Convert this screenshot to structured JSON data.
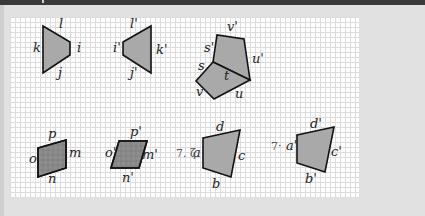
{
  "colors": {
    "fill": "#a9a9a9",
    "fill_dark": "#8e8e8e",
    "stroke": "#111111",
    "grid": "#dcdcdc",
    "background": "#e1e1e1"
  },
  "figures": [
    {
      "id": "trapezoid-1",
      "points": "43,26 70,42 70,55 43,73",
      "labels": [
        {
          "text": "l",
          "x": 59,
          "y": 28
        },
        {
          "text": "i",
          "x": 77,
          "y": 52
        },
        {
          "text": "j",
          "x": 58,
          "y": 77
        },
        {
          "text": "k",
          "x": 33,
          "y": 52
        }
      ]
    },
    {
      "id": "trapezoid-2",
      "points": "123,42 151,26 151,73 123,55",
      "labels": [
        {
          "text": "l'",
          "x": 130,
          "y": 28
        },
        {
          "text": "k'",
          "x": 156,
          "y": 54
        },
        {
          "text": "j'",
          "x": 130,
          "y": 77
        },
        {
          "text": "i'",
          "x": 113,
          "y": 52
        }
      ]
    },
    {
      "id": "upper-quad-3",
      "points": "213,62 217,35 244,39 250,80",
      "labels": [
        {
          "text": "v'",
          "x": 227,
          "y": 31
        },
        {
          "text": "s'",
          "x": 204,
          "y": 52
        },
        {
          "text": "u'",
          "x": 252,
          "y": 63
        }
      ]
    },
    {
      "id": "lower-quad-3",
      "points": "213,62 196,81 214,99 250,80",
      "labels": [
        {
          "text": "s",
          "x": 198,
          "y": 70
        },
        {
          "text": "t",
          "x": 224,
          "y": 80
        },
        {
          "text": "v",
          "x": 196,
          "y": 96
        },
        {
          "text": "u",
          "x": 235,
          "y": 98
        }
      ]
    },
    {
      "id": "parallelogram-4",
      "points": "38,148 66,140 66,168 38,177",
      "dark": true,
      "labels": [
        {
          "text": "p",
          "x": 48,
          "y": 138
        },
        {
          "text": "m",
          "x": 69,
          "y": 157
        },
        {
          "text": "n",
          "x": 48,
          "y": 183
        },
        {
          "text": "o",
          "x": 29,
          "y": 163
        }
      ]
    },
    {
      "id": "parallelogram-5",
      "points": "119,141 147,141 139,168 111,168",
      "dark": true,
      "labels": [
        {
          "text": "p'",
          "x": 130,
          "y": 136
        },
        {
          "text": "m'",
          "x": 142,
          "y": 159
        },
        {
          "text": "n'",
          "x": 122,
          "y": 182
        },
        {
          "text": "o'",
          "x": 105,
          "y": 157
        }
      ]
    },
    {
      "id": "quad-6",
      "points": "203,138 240,130 231,177 203,168",
      "labels": [
        {
          "text": "d",
          "x": 216,
          "y": 131
        },
        {
          "text": "c",
          "x": 238,
          "y": 160
        },
        {
          "text": "b",
          "x": 212,
          "y": 188
        },
        {
          "text": "a",
          "x": 193,
          "y": 157
        }
      ]
    },
    {
      "id": "quad-7",
      "points": "297,135 334,127 325,172 297,163",
      "labels": [
        {
          "text": "d'",
          "x": 310,
          "y": 128
        },
        {
          "text": "c'",
          "x": 331,
          "y": 156
        },
        {
          "text": "b'",
          "x": 305,
          "y": 183
        },
        {
          "text": "a'",
          "x": 286,
          "y": 150
        }
      ]
    }
  ],
  "annotations": [
    {
      "text": "7. ζ",
      "x": 176,
      "y": 157
    },
    {
      "text": "7·",
      "x": 271,
      "y": 150
    }
  ]
}
